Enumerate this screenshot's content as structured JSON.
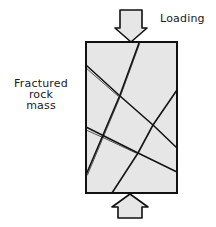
{
  "diagram": {
    "labels": {
      "loading": "Loading",
      "mass_line1": "Fractured",
      "mass_line2": "rock",
      "mass_line3": "mass"
    },
    "elements": {
      "specimen": "rock-specimen-block",
      "top_arrow": "loading-arrow-down",
      "bottom_arrow": "loading-arrow-up",
      "fractures_count": 4
    },
    "colors": {
      "fill": "#e6e6e6",
      "stroke": "#111111",
      "background": "#ffffff"
    }
  }
}
